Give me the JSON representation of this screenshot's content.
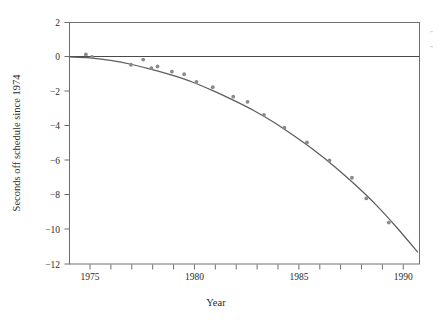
{
  "figure": {
    "background_color": "#ffffff",
    "frame_color": "#6e6e6e",
    "curve_color": "#5d5d5d",
    "point_color": "#8a8a8a",
    "zero_line_color": "#4a4a4a"
  },
  "chart_data": {
    "type": "scatter",
    "title": "",
    "xlabel": "Year",
    "ylabel": "Seconds off schedule since 1974",
    "xlim": [
      1974,
      1991.1
    ],
    "ylim": [
      -12,
      2
    ],
    "grid": false,
    "legend": null,
    "xticks_major": [
      1975,
      1980,
      1985,
      1990
    ],
    "xtick_labels": [
      "1975",
      "1980",
      "1985",
      "1990"
    ],
    "xticks_minor": [
      1975,
      1976,
      1977,
      1978,
      1979,
      1980,
      1981,
      1982,
      1983,
      1984,
      1985,
      1986,
      1987,
      1988,
      1989,
      1990
    ],
    "yticks": [
      2,
      0,
      -2,
      -4,
      -6,
      -8,
      -10,
      -12
    ],
    "ytick_labels": [
      "2",
      "0",
      "−2",
      "−4",
      "−6",
      "−8",
      "−10",
      "−12"
    ],
    "reference_lines": [
      {
        "axis": "y",
        "value": 0
      }
    ],
    "series": [
      {
        "name": "Observations",
        "type": "scatter",
        "x": [
          1974.8,
          1975.1,
          1977.0,
          1977.6,
          1978.0,
          1978.3,
          1979.0,
          1979.6,
          1980.2,
          1981.0,
          1982.0,
          1982.7,
          1983.5,
          1984.5,
          1985.6,
          1986.7,
          1987.8,
          1988.5,
          1989.6
        ],
        "y": [
          0.15,
          0.0,
          -0.45,
          -0.15,
          -0.65,
          -0.55,
          -0.85,
          -1.0,
          -1.45,
          -1.75,
          -2.3,
          -2.6,
          -3.35,
          -4.1,
          -4.95,
          -6.0,
          -7.0,
          -8.2,
          -9.6
        ]
      },
      {
        "name": "Fitted curve",
        "type": "line",
        "x": [
          1974.0,
          1975.0,
          1976.0,
          1977.0,
          1978.0,
          1979.0,
          1980.0,
          1981.0,
          1982.0,
          1983.0,
          1984.0,
          1985.0,
          1986.0,
          1987.0,
          1988.0,
          1989.0,
          1990.0,
          1991.0
        ],
        "y": [
          0.0,
          -0.05,
          -0.2,
          -0.42,
          -0.72,
          -1.05,
          -1.45,
          -1.95,
          -2.5,
          -3.1,
          -3.8,
          -4.6,
          -5.45,
          -6.4,
          -7.45,
          -8.6,
          -9.9,
          -11.3
        ]
      }
    ]
  }
}
